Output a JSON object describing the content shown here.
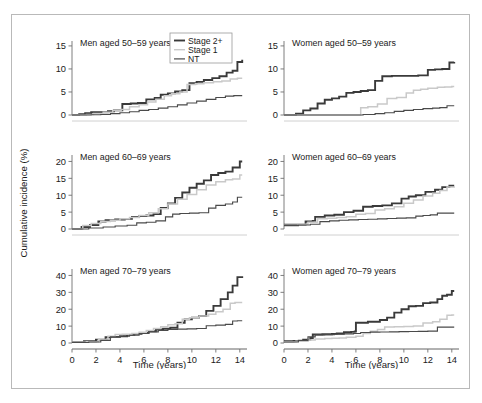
{
  "figure": {
    "ylabel": "Cumulative incidence (%)",
    "xlabel_left": "Time (years)",
    "xlabel_right": "Time (years)",
    "border_color": "#b9b9b9"
  },
  "legend": {
    "position": "top-center-of-first-panel",
    "entries": [
      {
        "label": "Stage 2+",
        "color": "#3a3a3a",
        "width": 1.9
      },
      {
        "label": "Stage 1",
        "color": "#c9c9c9",
        "width": 1.4
      },
      {
        "label": "NT",
        "color": "#4a4a4a",
        "width": 1.2
      }
    ]
  },
  "chart_data": [
    {
      "type": "line",
      "title": "Men aged 50–59 years",
      "panel": "top-left",
      "xlabel": "Time (years)",
      "ylabel": "Cumulative incidence (%)",
      "xlim": [
        0,
        14.6
      ],
      "ylim": [
        0,
        16.5
      ],
      "xticks": [
        0,
        2,
        4,
        6,
        8,
        10,
        12,
        14
      ],
      "yticks": [
        0,
        5,
        10,
        15
      ],
      "grid": false,
      "series": [
        {
          "name": "Stage 2+",
          "color": "#3a3a3a",
          "x": [
            0,
            0.6,
            1.1,
            1.6,
            2.2,
            3.0,
            3.5,
            4.2,
            4.9,
            5.5,
            6.2,
            6.9,
            7.4,
            8.0,
            8.6,
            9.2,
            9.8,
            10.4,
            11.0,
            11.7,
            12.3,
            12.9,
            13.4,
            13.8,
            14.2
          ],
          "y": [
            0,
            0.2,
            0.4,
            0.6,
            0.6,
            0.8,
            1.0,
            2.4,
            2.5,
            2.6,
            3.4,
            3.7,
            4.4,
            4.7,
            5.1,
            5.4,
            6.9,
            7.2,
            7.6,
            8.0,
            8.4,
            9.2,
            9.6,
            11.5,
            12.0
          ]
        },
        {
          "name": "Stage 1",
          "color": "#c9c9c9",
          "x": [
            0,
            1.2,
            1.8,
            2.6,
            3.4,
            4.1,
            4.8,
            5.6,
            6.3,
            7.0,
            7.7,
            8.3,
            9.0,
            9.6,
            10.3,
            11.0,
            11.8,
            12.5,
            13.2,
            13.8,
            14.2
          ],
          "y": [
            0,
            0.1,
            0.3,
            0.6,
            1.0,
            1.2,
            1.8,
            2.2,
            2.8,
            3.4,
            4.2,
            4.6,
            5.0,
            6.6,
            6.8,
            7.0,
            7.2,
            7.4,
            7.8,
            8.0,
            8.0
          ]
        },
        {
          "name": "NT",
          "color": "#4a4a4a",
          "x": [
            0,
            1.6,
            2.4,
            3.2,
            4.0,
            4.8,
            5.6,
            6.4,
            7.2,
            8.0,
            8.8,
            9.6,
            10.4,
            11.2,
            12.0,
            12.8,
            13.5,
            14.2
          ],
          "y": [
            0,
            0.05,
            0.1,
            0.3,
            0.5,
            0.7,
            1.0,
            1.2,
            1.5,
            1.8,
            2.2,
            2.6,
            3.0,
            3.4,
            3.8,
            4.1,
            4.2,
            4.2
          ]
        }
      ]
    },
    {
      "type": "line",
      "title": "Women aged 50–59 years",
      "panel": "top-right",
      "xlabel": "Time (years)",
      "ylabel": "Cumulative incidence (%)",
      "xlim": [
        0,
        14.6
      ],
      "ylim": [
        0,
        16.5
      ],
      "xticks": [
        0,
        2,
        4,
        6,
        8,
        10,
        12,
        14
      ],
      "yticks": [
        0,
        5,
        10,
        15
      ],
      "grid": false,
      "series": [
        {
          "name": "Stage 2+",
          "color": "#3a3a3a",
          "x": [
            0,
            1.0,
            1.6,
            2.2,
            2.8,
            3.4,
            4.0,
            4.6,
            5.2,
            5.8,
            6.4,
            7.0,
            7.6,
            8.2,
            9.0,
            10.0,
            11.2,
            12.0,
            12.6,
            13.2,
            13.8,
            14.2
          ],
          "y": [
            0,
            0.3,
            1.0,
            1.4,
            2.5,
            3.3,
            3.6,
            4.0,
            4.8,
            5.0,
            5.2,
            5.4,
            7.4,
            8.4,
            8.5,
            8.5,
            8.6,
            9.8,
            9.9,
            10.0,
            11.4,
            11.5
          ]
        },
        {
          "name": "Stage 1",
          "color": "#c9c9c9",
          "x": [
            0,
            6.0,
            6.4,
            7.0,
            7.8,
            8.6,
            9.4,
            10.2,
            10.8,
            11.4,
            12.0,
            12.8,
            13.4,
            14.0,
            14.2
          ],
          "y": [
            0,
            0.0,
            1.6,
            1.8,
            2.4,
            3.6,
            3.8,
            4.8,
            5.4,
            5.6,
            5.8,
            6.0,
            6.1,
            6.2,
            6.2
          ]
        },
        {
          "name": "NT",
          "color": "#4a4a4a",
          "x": [
            0,
            5.8,
            6.6,
            7.6,
            8.4,
            9.2,
            10.0,
            10.8,
            11.6,
            12.4,
            13.0,
            13.6,
            14.0,
            14.2
          ],
          "y": [
            0,
            0.0,
            0.1,
            0.3,
            0.5,
            0.8,
            1.0,
            1.2,
            1.4,
            1.5,
            1.6,
            2.0,
            2.0,
            2.0
          ]
        }
      ]
    },
    {
      "type": "line",
      "title": "Men aged 60–69 years",
      "panel": "middle-left",
      "xlabel": "Time (years)",
      "ylabel": "Cumulative incidence (%)",
      "xlim": [
        0,
        14.6
      ],
      "ylim": [
        0,
        22.5
      ],
      "xticks": [
        0,
        2,
        4,
        6,
        8,
        10,
        12,
        14
      ],
      "yticks": [
        0,
        5,
        10,
        15,
        20
      ],
      "grid": false,
      "series": [
        {
          "name": "Stage 2+",
          "color": "#3a3a3a",
          "x": [
            0,
            0.8,
            1.5,
            2.2,
            2.8,
            3.6,
            4.4,
            5.0,
            5.6,
            6.2,
            6.8,
            7.4,
            8.0,
            8.6,
            9.2,
            9.8,
            10.4,
            11.0,
            11.6,
            12.2,
            12.8,
            13.4,
            14.0,
            14.2
          ],
          "y": [
            0,
            0.6,
            1.2,
            2.2,
            2.6,
            2.8,
            3.0,
            3.6,
            3.8,
            4.0,
            4.4,
            6.2,
            7.6,
            9.2,
            10.8,
            12.2,
            13.4,
            14.4,
            16.0,
            16.6,
            17.0,
            18.2,
            20.0,
            20.0
          ]
        },
        {
          "name": "Stage 1",
          "color": "#c9c9c9",
          "x": [
            0,
            0.9,
            1.6,
            2.4,
            3.2,
            4.0,
            4.8,
            5.6,
            6.4,
            7.2,
            8.0,
            8.8,
            9.6,
            10.4,
            11.2,
            12.0,
            12.8,
            13.4,
            14.0,
            14.2
          ],
          "y": [
            0,
            1.0,
            1.6,
            2.2,
            2.6,
            3.0,
            3.4,
            4.0,
            4.8,
            6.0,
            7.4,
            8.8,
            10.2,
            11.6,
            13.0,
            14.0,
            14.6,
            14.8,
            16.0,
            16.0
          ]
        },
        {
          "name": "NT",
          "color": "#4a4a4a",
          "x": [
            0,
            1.4,
            2.6,
            3.6,
            4.6,
            5.4,
            6.2,
            7.0,
            7.8,
            8.4,
            9.0,
            9.8,
            10.6,
            11.4,
            12.0,
            12.8,
            13.4,
            13.8,
            14.2
          ],
          "y": [
            0,
            0.3,
            0.6,
            0.9,
            1.1,
            1.8,
            2.0,
            2.4,
            3.6,
            4.4,
            4.6,
            4.7,
            4.8,
            6.2,
            7.0,
            7.4,
            8.0,
            9.4,
            9.4
          ]
        }
      ]
    },
    {
      "type": "line",
      "title": "Women aged 60–69 years",
      "panel": "middle-right",
      "xlabel": "Time (years)",
      "ylabel": "Cumulative incidence (%)",
      "xlim": [
        0,
        14.6
      ],
      "ylim": [
        0,
        22.5
      ],
      "xticks": [
        0,
        2,
        4,
        6,
        8,
        10,
        12,
        14
      ],
      "yticks": [
        0,
        5,
        10,
        15,
        20
      ],
      "grid": false,
      "series": [
        {
          "name": "Stage 2+",
          "color": "#3a3a3a",
          "x": [
            0,
            1.0,
            1.8,
            2.4,
            2.6,
            3.4,
            4.2,
            5.0,
            5.8,
            6.6,
            7.4,
            8.2,
            9.0,
            9.8,
            10.4,
            11.0,
            11.8,
            12.6,
            13.2,
            13.8,
            14.2
          ],
          "y": [
            1.3,
            1.3,
            2.2,
            2.4,
            3.6,
            4.0,
            4.2,
            5.0,
            5.4,
            6.6,
            6.8,
            7.0,
            7.6,
            9.0,
            9.6,
            10.0,
            11.0,
            11.6,
            12.4,
            12.8,
            12.8
          ]
        },
        {
          "name": "Stage 1",
          "color": "#c9c9c9",
          "x": [
            0,
            1.2,
            2.0,
            2.8,
            3.6,
            4.4,
            5.2,
            6.0,
            6.8,
            7.6,
            8.4,
            9.2,
            10.0,
            10.8,
            11.6,
            12.4,
            13.0,
            13.6,
            14.2
          ],
          "y": [
            1.1,
            1.4,
            2.0,
            3.0,
            3.2,
            3.4,
            3.6,
            4.4,
            4.6,
            5.6,
            6.0,
            6.6,
            7.6,
            8.6,
            9.8,
            10.6,
            11.4,
            12.4,
            12.6
          ]
        },
        {
          "name": "NT",
          "color": "#4a4a4a",
          "x": [
            0,
            1.2,
            2.2,
            3.0,
            3.8,
            4.6,
            5.4,
            6.2,
            7.0,
            7.8,
            8.6,
            9.4,
            10.2,
            11.0,
            11.6,
            12.2,
            12.8,
            14.2
          ],
          "y": [
            1.0,
            1.2,
            1.4,
            2.2,
            2.4,
            2.6,
            2.7,
            2.8,
            2.9,
            3.0,
            3.1,
            3.2,
            3.3,
            3.8,
            4.0,
            4.2,
            4.7,
            4.7
          ]
        }
      ]
    },
    {
      "type": "line",
      "title": "Men aged 70–79 years",
      "panel": "bottom-left",
      "xlabel": "Time (years)",
      "ylabel": "Cumulative incidence (%)",
      "xlim": [
        0,
        14.6
      ],
      "ylim": [
        0,
        45
      ],
      "xticks": [
        0,
        2,
        4,
        6,
        8,
        10,
        12,
        14
      ],
      "yticks": [
        0,
        10,
        20,
        30,
        40
      ],
      "grid": false,
      "series": [
        {
          "name": "Stage 2+",
          "color": "#3a3a3a",
          "x": [
            0,
            1.0,
            2.0,
            2.8,
            3.2,
            4.0,
            4.6,
            5.2,
            5.8,
            6.4,
            7.0,
            7.6,
            8.2,
            8.8,
            9.4,
            10.0,
            10.6,
            11.2,
            11.8,
            12.4,
            13.0,
            13.4,
            13.8,
            14.2
          ],
          "y": [
            0.5,
            1.0,
            2.0,
            3.4,
            3.6,
            4.0,
            4.8,
            5.4,
            6.0,
            7.0,
            8.0,
            8.4,
            9.0,
            12.0,
            14.0,
            15.0,
            16.0,
            19.0,
            22.0,
            26.0,
            30.0,
            34.0,
            39.0,
            39.5
          ]
        },
        {
          "name": "Stage 1",
          "color": "#c9c9c9",
          "x": [
            0,
            1.2,
            2.2,
            3.0,
            3.6,
            4.2,
            5.0,
            5.6,
            6.2,
            6.8,
            7.4,
            8.0,
            8.6,
            9.2,
            9.8,
            10.6,
            11.4,
            12.0,
            12.6,
            13.2,
            13.6,
            14.2
          ],
          "y": [
            0.4,
            0.8,
            2.0,
            4.0,
            5.0,
            5.2,
            5.6,
            6.4,
            7.4,
            8.6,
            9.6,
            10.8,
            11.4,
            14.0,
            15.0,
            16.0,
            17.0,
            18.5,
            20.0,
            23.5,
            24.0,
            24.0
          ]
        },
        {
          "name": "NT",
          "color": "#4a4a4a",
          "x": [
            0,
            1.4,
            2.4,
            3.2,
            4.0,
            4.8,
            5.6,
            6.4,
            7.2,
            8.0,
            8.8,
            9.6,
            10.4,
            11.2,
            12.0,
            12.8,
            13.4,
            13.8,
            14.2
          ],
          "y": [
            0.3,
            0.6,
            1.6,
            3.6,
            4.0,
            4.6,
            5.6,
            6.6,
            7.4,
            8.0,
            8.2,
            8.4,
            8.6,
            10.2,
            10.6,
            11.0,
            13.0,
            13.2,
            13.2
          ]
        }
      ]
    },
    {
      "type": "line",
      "title": "Women aged 70–79 years",
      "panel": "bottom-right",
      "xlabel": "Time (years)",
      "ylabel": "Cumulative incidence (%)",
      "xlim": [
        0,
        14.6
      ],
      "ylim": [
        0,
        45
      ],
      "xticks": [
        0,
        2,
        4,
        6,
        8,
        10,
        12,
        14
      ],
      "yticks": [
        0,
        10,
        20,
        30,
        40
      ],
      "grid": false,
      "series": [
        {
          "name": "Stage 2+",
          "color": "#3a3a3a",
          "x": [
            0,
            0.8,
            1.6,
            2.2,
            2.4,
            3.2,
            4.0,
            4.4,
            5.0,
            5.6,
            5.9,
            6.0,
            7.0,
            8.0,
            8.6,
            9.2,
            9.8,
            10.4,
            11.0,
            11.6,
            12.2,
            12.8,
            13.2,
            13.6,
            14.0,
            14.2
          ],
          "y": [
            1.0,
            1.2,
            2.0,
            3.0,
            5.0,
            5.2,
            5.4,
            5.6,
            6.4,
            6.6,
            6.8,
            12.0,
            12.6,
            13.6,
            15.0,
            18.0,
            20.0,
            21.8,
            22.0,
            23.6,
            24.0,
            26.0,
            28.0,
            28.6,
            30.8,
            30.8
          ]
        },
        {
          "name": "Stage 1",
          "color": "#c9c9c9",
          "x": [
            0,
            1.0,
            2.0,
            2.6,
            3.4,
            4.0,
            4.6,
            5.2,
            6.0,
            6.6,
            7.2,
            7.8,
            8.4,
            9.2,
            10.0,
            10.8,
            11.6,
            12.4,
            13.0,
            13.6,
            14.0,
            14.2
          ],
          "y": [
            0.8,
            1.0,
            1.8,
            2.4,
            2.6,
            2.8,
            3.0,
            3.4,
            4.0,
            5.6,
            7.0,
            8.0,
            9.4,
            9.6,
            9.8,
            10.0,
            11.8,
            12.6,
            14.0,
            16.4,
            16.6,
            16.6
          ]
        },
        {
          "name": "NT",
          "color": "#4a4a4a",
          "x": [
            0,
            1.2,
            2.0,
            2.6,
            3.4,
            4.2,
            5.0,
            5.8,
            6.4,
            7.2,
            8.0,
            8.8,
            9.6,
            10.4,
            11.2,
            12.0,
            12.6,
            12.8,
            13.6,
            14.2
          ],
          "y": [
            0.6,
            1.6,
            3.6,
            4.8,
            5.0,
            5.2,
            5.4,
            5.6,
            6.2,
            6.4,
            6.5,
            6.6,
            6.7,
            6.8,
            6.9,
            7.0,
            7.0,
            9.4,
            9.4,
            9.4
          ]
        }
      ]
    }
  ]
}
